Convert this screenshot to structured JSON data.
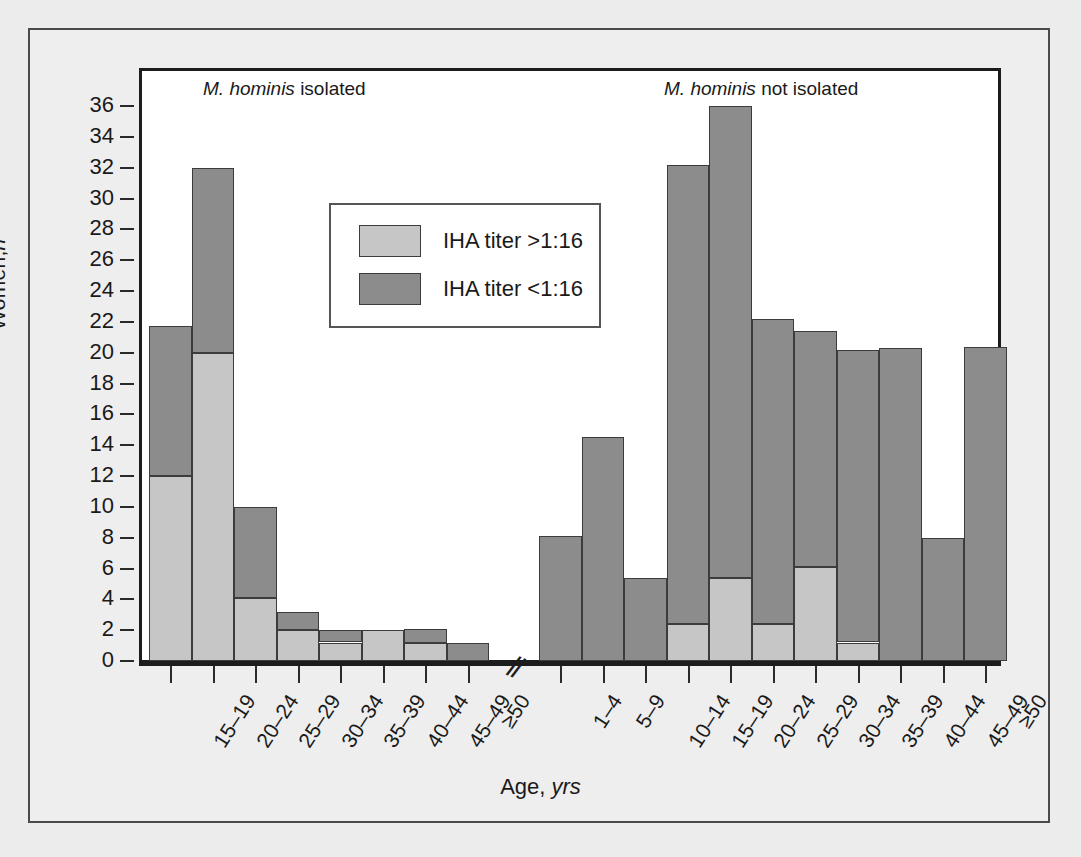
{
  "figure": {
    "y_axis_title_main": "Women,",
    "y_axis_title_italic": "n",
    "x_axis_title_main": "Age,",
    "x_axis_title_italic": "yrs",
    "panel_titles": {
      "left_italic": "M. hominis",
      "left_rest": " isolated",
      "right_italic": "M. hominis",
      "right_rest": " not isolated"
    },
    "axis_break_glyph": "//"
  },
  "legend": {
    "position": "inside-top-center-left",
    "entries": [
      {
        "label": "IHA titer >1:16",
        "color": "#c6c6c6",
        "key": "hi"
      },
      {
        "label": "IHA titer <1:16",
        "color": "#8c8c8c",
        "key": "lo"
      }
    ]
  },
  "colors": {
    "high_titer": "#c6c6c6",
    "low_titer": "#8c8c8c",
    "axis": "#1c1c1c",
    "page_background": "#ececec",
    "panel_background": "#ffffff",
    "bar_outline": "#3c3c3c"
  },
  "chart_data": {
    "type": "bar",
    "title": "",
    "subtitle": "",
    "xlabel": "Age, yrs",
    "ylabel": "Women, n",
    "ylim": [
      0,
      36
    ],
    "ytick_step": 2,
    "yticks": [
      0,
      2,
      4,
      6,
      8,
      10,
      12,
      14,
      16,
      18,
      20,
      22,
      24,
      26,
      28,
      30,
      32,
      34,
      36
    ],
    "grid": false,
    "stacked": true,
    "legend_position": "inside upper-center-left",
    "series": [
      {
        "name": "IHA titer >1:16",
        "key": "hi",
        "color": "#c6c6c6"
      },
      {
        "name": "IHA titer <1:16",
        "key": "lo",
        "color": "#8c8c8c"
      }
    ],
    "panels": [
      {
        "name": "M. hominis isolated",
        "categories": [
          "15–19",
          "20–24",
          "25–29",
          "30–34",
          "35–39",
          "40–44",
          "45–49",
          "≥50"
        ],
        "high_titer": [
          12.0,
          20.0,
          4.1,
          2.0,
          1.2,
          2.0,
          1.2,
          0.0
        ],
        "low_titer": [
          9.7,
          12.0,
          5.9,
          1.2,
          0.8,
          0.0,
          0.9,
          1.2
        ],
        "totals": [
          21.7,
          32.0,
          10.0,
          3.2,
          2.0,
          2.0,
          2.1,
          1.2
        ]
      },
      {
        "name": "M. hominis not isolated",
        "categories": [
          "1–4",
          "5–9",
          "10–14",
          "15–19",
          "20–24",
          "25–29",
          "30–34",
          "35–39",
          "40–44",
          "45–49",
          "≥50"
        ],
        "high_titer": [
          0.0,
          0.0,
          0.0,
          2.4,
          5.4,
          2.4,
          6.1,
          1.2,
          0.0,
          0.0,
          0.0
        ],
        "low_titer": [
          8.1,
          14.5,
          5.4,
          29.8,
          30.6,
          19.8,
          15.3,
          19.0,
          20.3,
          8.0,
          20.4
        ],
        "totals": [
          8.1,
          14.5,
          5.4,
          32.2,
          36.0,
          22.2,
          21.4,
          20.2,
          20.3,
          8.0,
          20.4
        ]
      }
    ]
  }
}
